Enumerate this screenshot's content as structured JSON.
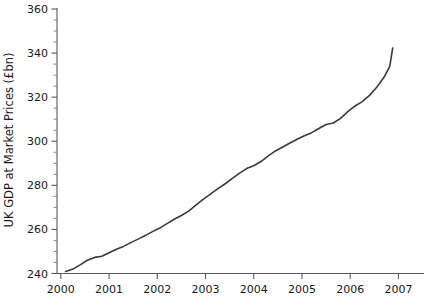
{
  "chart_data": {
    "type": "line",
    "title": "",
    "xlabel": "",
    "ylabel": "UK GDP at Market Prices (£bn)",
    "xlim": [
      1999.92,
      2007.25
    ],
    "ylim": [
      240,
      360
    ],
    "grid": false,
    "legend": null,
    "y_ticks": [
      240,
      260,
      280,
      300,
      320,
      340,
      360
    ],
    "y_tick_labels": [
      "240",
      "260",
      "280",
      "300",
      "320",
      "340",
      "360"
    ],
    "y_minor_step": 5,
    "x_ticks": [
      2000,
      2001,
      2002,
      2003,
      2004,
      2005,
      2006,
      2007
    ],
    "x_tick_labels": [
      "2000",
      "2001",
      "2002",
      "2003",
      "2004",
      "2005",
      "2006",
      "2007"
    ],
    "line_color": "#3a3a3a",
    "series": [
      {
        "name": "UK GDP at Market Prices",
        "x": [
          2000.1,
          2000.25,
          2000.4,
          2000.55,
          2000.7,
          2000.85,
          2001.0,
          2001.15,
          2001.3,
          2001.45,
          2001.6,
          2001.75,
          2001.9,
          2002.05,
          2002.2,
          2002.35,
          2002.5,
          2002.65,
          2002.8,
          2002.95,
          2003.1,
          2003.25,
          2003.4,
          2003.55,
          2003.7,
          2003.85,
          2004.0,
          2004.15,
          2004.3,
          2004.45,
          2004.6,
          2004.75,
          2004.9,
          2005.05,
          2005.2,
          2005.35,
          2005.5,
          2005.65,
          2005.8,
          2005.95,
          2006.1,
          2006.25,
          2006.4,
          2006.55,
          2006.7,
          2006.82
        ],
        "y": [
          240.9,
          242.0,
          243.9,
          246.0,
          247.3,
          247.8,
          249.4,
          251.0,
          252.3,
          254.0,
          255.6,
          257.2,
          259.0,
          260.6,
          262.6,
          264.6,
          266.3,
          268.3,
          271.0,
          273.6,
          276.0,
          278.4,
          280.6,
          283.0,
          285.4,
          287.6,
          288.9,
          290.8,
          293.4,
          295.6,
          297.4,
          299.2,
          300.9,
          302.5,
          303.9,
          305.8,
          307.6,
          308.3,
          310.4,
          313.4,
          316.0,
          318.0,
          320.8,
          324.5,
          329.0,
          334.0
        ]
      }
    ],
    "end_value": 342.3,
    "start_value": 240.9
  },
  "axes": {
    "y_axis_title": "UK GDP at Market Prices (£bn)"
  }
}
